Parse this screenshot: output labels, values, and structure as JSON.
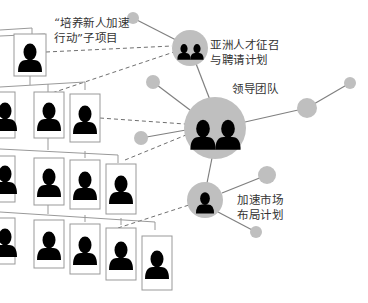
{
  "diagram": {
    "title": "",
    "labels": {
      "project": {
        "line1": "“培养新人加速",
        "line2": "行动”子项目"
      },
      "asia": {
        "line1": "亚洲人才征召",
        "line2": "与聘请计划"
      },
      "leader": {
        "line1": "领导团队"
      },
      "market": {
        "line1": "加速市场",
        "line2": "布局计划"
      }
    },
    "colors": {
      "node_fill": "#bfbfbf",
      "silhouette": "#000000",
      "line": "#808080",
      "dashed": "#707070",
      "card_border": "#999999"
    },
    "nodes": [
      {
        "id": "asia",
        "label": "亚洲人才征召与聘请计划",
        "people": 2
      },
      {
        "id": "leader",
        "label": "领导团队",
        "people": 2
      },
      {
        "id": "market",
        "label": "加速市场布局计划",
        "people": 1
      }
    ],
    "org_chart": {
      "rows": [
        {
          "level": 1,
          "cards": 1
        },
        {
          "level": 2,
          "cards": 3
        },
        {
          "level": 3,
          "cards": 4
        },
        {
          "level": 4,
          "cards": 5
        }
      ]
    }
  }
}
